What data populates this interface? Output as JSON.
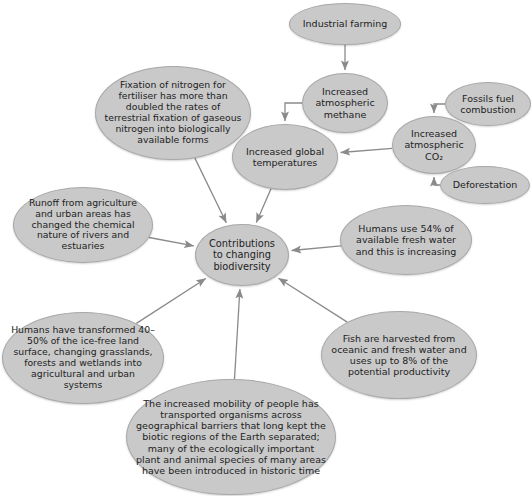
{
  "diagram": {
    "title": "Contributions to changing biodiversity",
    "type": "concept-map",
    "node_fill": "#c9c9c9",
    "node_stroke": "#a8a8a8",
    "connector_color": "#8a8a8a",
    "text_color": "#222222",
    "nodes": [
      {
        "id": "industrial-farming",
        "label": "Industrial farming",
        "cx": 345,
        "cy": 24,
        "rx": 56,
        "ry": 21,
        "font": 9.5
      },
      {
        "id": "nitrogen-fixation",
        "label": "Fixation of nitrogen for fertiliser has more than doubled the rates of terrestrial fixation of gaseous nitrogen into biologically available forms",
        "cx": 173,
        "cy": 113,
        "rx": 78,
        "ry": 47,
        "font": 9.3
      },
      {
        "id": "atmospheric-methane",
        "label": "Increased atmospheric methane",
        "cx": 345,
        "cy": 103,
        "rx": 43,
        "ry": 30,
        "font": 9.5
      },
      {
        "id": "fossil-fuel-combustion",
        "label": "Fossils fuel combustion",
        "cx": 488,
        "cy": 104,
        "rx": 43,
        "ry": 22,
        "font": 9.5
      },
      {
        "id": "atmospheric-co2",
        "label": "Increased atmospheric CO₂",
        "cx": 434,
        "cy": 145,
        "rx": 42,
        "ry": 29,
        "font": 9.5
      },
      {
        "id": "deforestation",
        "label": "Deforestation",
        "cx": 485,
        "cy": 185,
        "rx": 45,
        "ry": 19,
        "font": 9.5
      },
      {
        "id": "global-temperatures",
        "label": "Increased global temperatures",
        "cx": 285,
        "cy": 157,
        "rx": 53,
        "ry": 33,
        "font": 9.5
      },
      {
        "id": "agricultural-runoff",
        "label": "Runoff from agriculture and urban areas has changed the chemical nature of rivers and estuaries",
        "cx": 83,
        "cy": 225,
        "rx": 70,
        "ry": 38,
        "font": 9.3
      },
      {
        "id": "contributions-biodiversity",
        "label": "Contributions to changing biodiversity",
        "cx": 242,
        "cy": 255,
        "rx": 47,
        "ry": 31,
        "font": 9.8
      },
      {
        "id": "fresh-water-use",
        "label": "Humans use 54% of available fresh water and this is increasing",
        "cx": 406,
        "cy": 240,
        "rx": 66,
        "ry": 35,
        "font": 9.5
      },
      {
        "id": "land-transformation",
        "label": "Humans have transformed 40–50% of the ice-free land surface, changing grasslands, forests and wetlands into agricultural and urban systems",
        "cx": 83,
        "cy": 358,
        "rx": 81,
        "ry": 46,
        "font": 9.3
      },
      {
        "id": "fish-harvesting",
        "label": "Fish are harvested from oceanic and fresh water and uses up to 8% of the potential productivity",
        "cx": 399,
        "cy": 355,
        "rx": 78,
        "ry": 44,
        "font": 9.5
      },
      {
        "id": "species-mobility",
        "label": "The increased mobility of people has transported organisms across geographical barriers that long kept the biotic regions of the Earth separated; many of the ecologically important plant and animal species of many areas have been introduced in historic time",
        "cx": 231,
        "cy": 437,
        "rx": 105,
        "ry": 58,
        "font": 9.5
      }
    ],
    "connectors": [
      {
        "id": "farming-to-methane",
        "from": "industrial-farming",
        "to": "atmospheric-methane",
        "style": "straight"
      },
      {
        "id": "methane-to-temperatures",
        "from": "atmospheric-methane",
        "to": "global-temperatures",
        "style": "elbow"
      },
      {
        "id": "fossilfuel-to-co2",
        "from": "fossil-fuel-combustion",
        "to": "atmospheric-co2",
        "style": "elbow"
      },
      {
        "id": "deforestation-to-co2",
        "from": "deforestation",
        "to": "atmospheric-co2",
        "style": "elbow"
      },
      {
        "id": "co2-to-temperatures",
        "from": "atmospheric-co2",
        "to": "global-temperatures",
        "style": "straight"
      },
      {
        "id": "nitrogen-to-contributions",
        "from": "nitrogen-fixation",
        "to": "contributions-biodiversity",
        "style": "straight"
      },
      {
        "id": "temperatures-to-contributions",
        "from": "global-temperatures",
        "to": "contributions-biodiversity",
        "style": "straight"
      },
      {
        "id": "runoff-to-contributions",
        "from": "agricultural-runoff",
        "to": "contributions-biodiversity",
        "style": "straight"
      },
      {
        "id": "freshwater-to-contributions",
        "from": "fresh-water-use",
        "to": "contributions-biodiversity",
        "style": "straight"
      },
      {
        "id": "land-to-contributions",
        "from": "land-transformation",
        "to": "contributions-biodiversity",
        "style": "straight"
      },
      {
        "id": "fish-to-contributions",
        "from": "fish-harvesting",
        "to": "contributions-biodiversity",
        "style": "straight"
      },
      {
        "id": "mobility-to-contributions",
        "from": "species-mobility",
        "to": "contributions-biodiversity",
        "style": "straight"
      }
    ]
  }
}
